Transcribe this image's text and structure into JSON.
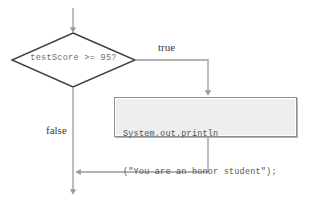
{
  "diagram": {
    "type": "flowchart",
    "decision": {
      "shape": "diamond",
      "condition": "testScore >= 95?",
      "border_color": "#3d3d3d",
      "fill_color": "#ffffff"
    },
    "process": {
      "shape": "rectangle",
      "code_line_1": "System.out.println",
      "code_line_2": "(\"You are an honor student\");",
      "fill_color": "#eeeeee",
      "border_color": "#8f8f8f"
    },
    "edges": {
      "true_label": "true",
      "false_label": "false",
      "line_color": "#9a9a9a"
    }
  }
}
